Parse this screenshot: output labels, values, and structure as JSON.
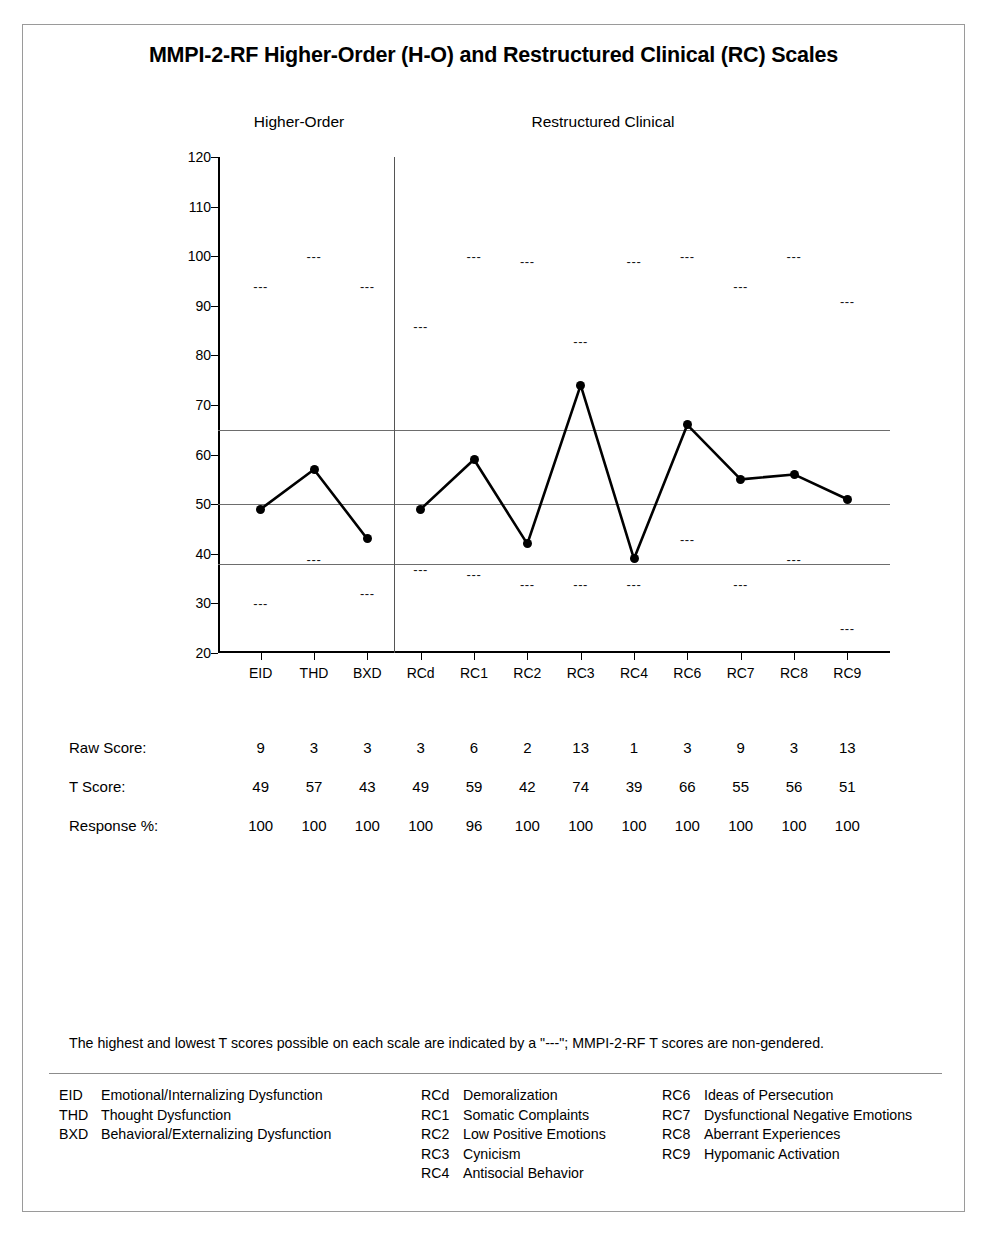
{
  "report": {
    "title": "MMPI-2-RF Higher-Order (H-O) and Restructured Clinical (RC) Scales",
    "section_headings": {
      "higher_order": "Higher-Order",
      "restructured_clinical": "Restructured Clinical"
    },
    "footnote": "The highest and lowest T scores possible on each scale are indicated by a \"---\"; MMPI-2-RF T scores are non-gendered.",
    "dash_marker_glyph": "---"
  },
  "rows": {
    "raw_score_label": "Raw Score:",
    "t_score_label": "T Score:",
    "response_pct_label": "Response %:"
  },
  "legend": {
    "columns": [
      {
        "entries": [
          {
            "abbr": "EID",
            "name": "Emotional/Internalizing Dysfunction"
          },
          {
            "abbr": "THD",
            "name": "Thought Dysfunction"
          },
          {
            "abbr": "BXD",
            "name": "Behavioral/Externalizing Dysfunction"
          }
        ]
      },
      {
        "entries": [
          {
            "abbr": "RCd",
            "name": "Demoralization"
          },
          {
            "abbr": "RC1",
            "name": "Somatic Complaints"
          },
          {
            "abbr": "RC2",
            "name": "Low Positive Emotions"
          },
          {
            "abbr": "RC3",
            "name": "Cynicism"
          },
          {
            "abbr": "RC4",
            "name": "Antisocial Behavior"
          }
        ]
      },
      {
        "entries": [
          {
            "abbr": "RC6",
            "name": "Ideas of Persecution"
          },
          {
            "abbr": "RC7",
            "name": "Dysfunctional Negative Emotions"
          },
          {
            "abbr": "RC8",
            "name": "Aberrant Experiences"
          },
          {
            "abbr": "RC9",
            "name": "Hypomanic Activation"
          }
        ]
      }
    ]
  },
  "chart_data": {
    "type": "line",
    "title": "MMPI-2-RF Higher-Order (H-O) and Restructured Clinical (RC) Scales",
    "xlabel": "",
    "ylabel": "T Score",
    "ylim": [
      20,
      120
    ],
    "ytick_step": 10,
    "yticks": [
      20,
      30,
      40,
      50,
      60,
      70,
      80,
      90,
      100,
      110,
      120
    ],
    "grid": false,
    "legend_position": "none",
    "reference_lines": [
      65,
      50,
      38
    ],
    "group_divider_after_index": 2,
    "groups": [
      {
        "name": "Higher-Order",
        "scales": [
          "EID",
          "THD",
          "BXD"
        ]
      },
      {
        "name": "Restructured Clinical",
        "scales": [
          "RCd",
          "RC1",
          "RC2",
          "RC3",
          "RC4",
          "RC6",
          "RC7",
          "RC8",
          "RC9"
        ]
      }
    ],
    "categories": [
      "EID",
      "THD",
      "BXD",
      "RCd",
      "RC1",
      "RC2",
      "RC3",
      "RC4",
      "RC6",
      "RC7",
      "RC8",
      "RC9"
    ],
    "series": [
      {
        "name": "T Score",
        "values": [
          49,
          57,
          43,
          49,
          59,
          42,
          74,
          39,
          66,
          55,
          56,
          51
        ]
      },
      {
        "name": "Raw Score",
        "values": [
          9,
          3,
          3,
          3,
          6,
          2,
          13,
          1,
          3,
          9,
          3,
          13
        ]
      },
      {
        "name": "Response %",
        "values": [
          100,
          100,
          100,
          100,
          96,
          100,
          100,
          100,
          100,
          100,
          100,
          100
        ]
      },
      {
        "name": "Highest T possible",
        "values": [
          94,
          100,
          94,
          86,
          100,
          99,
          83,
          99,
          100,
          94,
          100,
          91
        ]
      },
      {
        "name": "Lowest T possible",
        "values": [
          30,
          39,
          32,
          37,
          36,
          34,
          34,
          34,
          43,
          34,
          39,
          25
        ]
      }
    ]
  }
}
